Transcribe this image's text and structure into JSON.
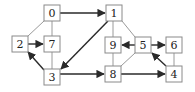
{
  "diagram": {
    "type": "directed-graph",
    "colors": {
      "node_border": "#8a8a8a",
      "directed_edge": "#2a2a2a",
      "undirected_edge": "#9a9a9a",
      "background": "#ffffff"
    },
    "nodes": [
      {
        "id": "0",
        "label": "0",
        "x": 44,
        "y": 5
      },
      {
        "id": "1",
        "label": "1",
        "x": 106,
        "y": 5
      },
      {
        "id": "2",
        "label": "2",
        "x": 12,
        "y": 36
      },
      {
        "id": "7",
        "label": "7",
        "x": 44,
        "y": 36
      },
      {
        "id": "9",
        "label": "9",
        "x": 105,
        "y": 37
      },
      {
        "id": "5",
        "label": "5",
        "x": 135,
        "y": 37
      },
      {
        "id": "6",
        "label": "6",
        "x": 166,
        "y": 37
      },
      {
        "id": "3",
        "label": "3",
        "x": 44,
        "y": 69
      },
      {
        "id": "8",
        "label": "8",
        "x": 105,
        "y": 66
      },
      {
        "id": "4",
        "label": "4",
        "x": 166,
        "y": 66
      }
    ],
    "directed_edges": [
      {
        "from": "0",
        "to": "1"
      },
      {
        "from": "1",
        "to": "3"
      },
      {
        "from": "2",
        "to": "7"
      },
      {
        "from": "3",
        "to": "2"
      },
      {
        "from": "3",
        "to": "8"
      },
      {
        "from": "8",
        "to": "4"
      },
      {
        "from": "4",
        "to": "5"
      },
      {
        "from": "5",
        "to": "9"
      },
      {
        "from": "5",
        "to": "6"
      }
    ],
    "undirected_edges": [
      {
        "a": "0",
        "b": "2"
      },
      {
        "a": "0",
        "b": "7"
      },
      {
        "a": "7",
        "b": "3"
      },
      {
        "a": "1",
        "b": "9"
      },
      {
        "a": "1",
        "b": "5"
      },
      {
        "a": "9",
        "b": "8"
      },
      {
        "a": "5",
        "b": "8"
      },
      {
        "a": "6",
        "b": "4"
      }
    ]
  }
}
